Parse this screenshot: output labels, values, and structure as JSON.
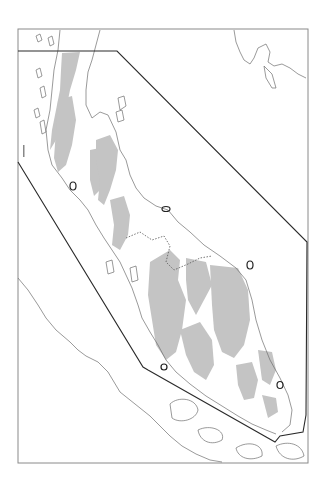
{
  "figure": {
    "type": "map",
    "region": "Malay Peninsula",
    "width": 325,
    "height": 487,
    "frame": {
      "x": 18,
      "y": 29,
      "width": 290,
      "height": 434,
      "stroke": "#8a8a8a"
    }
  },
  "colors": {
    "background": "#ffffff",
    "highland_fill": "#c4c4c4",
    "coastline": "#6e6e6e",
    "boundary": "#2a2a2a",
    "border_dashed": "#555555",
    "marker": "#222222"
  },
  "layers": {
    "study_area_polygon": {
      "label": "study-area boundary",
      "points": [
        [
          18,
          51
        ],
        [
          117,
          51
        ],
        [
          307,
          242
        ],
        [
          306,
          415
        ],
        [
          303,
          432
        ],
        [
          280,
          436
        ],
        [
          275,
          442
        ],
        [
          148,
          370
        ],
        [
          143,
          367
        ],
        [
          18,
          162
        ]
      ]
    },
    "highlands": {
      "label": "highland / upland areas (shaded)"
    },
    "coastlines": {
      "label": "coastline"
    },
    "national_border": {
      "label": "Thailand–Malaysia border (dotted)"
    },
    "markers": {
      "label": "site markers (ovals)",
      "items": [
        {
          "cx": 73,
          "cy": 186
        },
        {
          "cx": 166,
          "cy": 209
        },
        {
          "cx": 250,
          "cy": 265
        },
        {
          "cx": 164,
          "cy": 367
        },
        {
          "cx": 280,
          "cy": 385
        }
      ]
    }
  },
  "annotations": {
    "left_edge_mark": "scale tick (illegible)"
  }
}
